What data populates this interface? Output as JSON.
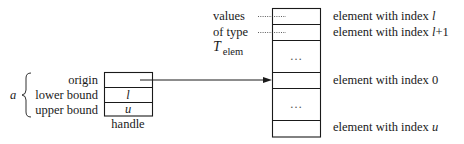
{
  "diagram": {
    "handle": {
      "name": "a",
      "caption": "handle",
      "fields": [
        {
          "label": "origin",
          "value": ""
        },
        {
          "label": "lower bound",
          "value": "l"
        },
        {
          "label": "upper bound",
          "value": "u"
        }
      ]
    },
    "array": {
      "side_label": {
        "line1": "values",
        "line2": "of type",
        "type_symbol": "T",
        "type_subscript": "elem"
      },
      "cells": [
        {
          "content": "",
          "annotation_prefix": "element with index ",
          "annotation_index": "l"
        },
        {
          "content": "",
          "annotation_prefix": "element with index ",
          "annotation_index": "l+1"
        },
        {
          "content": "…",
          "annotation_prefix": "",
          "annotation_index": ""
        },
        {
          "content": "",
          "annotation_prefix": "element with index ",
          "annotation_index": "0"
        },
        {
          "content": "…",
          "annotation_prefix": "",
          "annotation_index": ""
        },
        {
          "content": "",
          "annotation_prefix": "element with index ",
          "annotation_index": "u"
        }
      ]
    },
    "connector": {
      "from": "origin",
      "to": "element with index 0",
      "style": "arrow"
    }
  }
}
